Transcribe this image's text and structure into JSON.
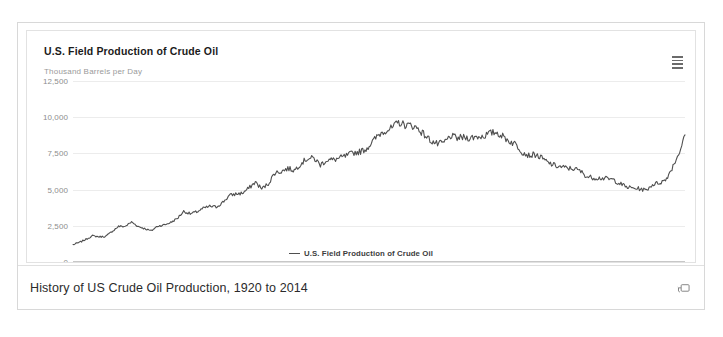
{
  "card": {
    "chart": {
      "title": "U.S. Field Production of Crude Oil",
      "yaxis_title": "Thousand Barrels per Day",
      "menu_icon": "hamburger-menu-icon",
      "legend": {
        "marker": "line-dash-marker",
        "label": "U.S. Field Production of Crude Oil"
      }
    },
    "footer": {
      "caption": "History of US Crude Oil Production, 1920 to 2014",
      "popout_icon": "popout-window-icon"
    }
  },
  "chart_data": {
    "type": "line",
    "title": "U.S. Field Production of Crude Oil",
    "subtitle": "",
    "xlabel": "",
    "ylabel": "Thousand Barrels per Day",
    "xlim": [
      1920,
      2014
    ],
    "ylim": [
      0,
      12500
    ],
    "ytick_labels": [
      "0",
      "2,500",
      "5,000",
      "7,500",
      "10,000",
      "12,500"
    ],
    "ytick_values": [
      0,
      2500,
      5000,
      7500,
      10000,
      12500
    ],
    "xtick_labels": [
      "1920",
      "1930",
      "1940",
      "1950",
      "1960",
      "1970",
      "1980",
      "1990",
      "2000",
      "2010"
    ],
    "xtick_values": [
      1920,
      1930,
      1940,
      1950,
      1960,
      1970,
      1980,
      1990,
      2000,
      2010
    ],
    "grid": true,
    "legend_position": "bottom-center",
    "line_color": "#4f4f4f",
    "series": [
      {
        "name": "U.S. Field Production of Crude Oil",
        "x": [
          1920,
          1921,
          1922,
          1923,
          1924,
          1925,
          1926,
          1927,
          1928,
          1929,
          1930,
          1931,
          1932,
          1933,
          1934,
          1935,
          1936,
          1937,
          1938,
          1939,
          1940,
          1941,
          1942,
          1943,
          1944,
          1945,
          1946,
          1947,
          1948,
          1949,
          1950,
          1951,
          1952,
          1953,
          1954,
          1955,
          1956,
          1957,
          1958,
          1959,
          1960,
          1961,
          1962,
          1963,
          1964,
          1965,
          1966,
          1967,
          1968,
          1969,
          1970,
          1971,
          1972,
          1973,
          1974,
          1975,
          1976,
          1977,
          1978,
          1979,
          1980,
          1981,
          1982,
          1983,
          1984,
          1985,
          1986,
          1987,
          1988,
          1989,
          1990,
          1991,
          1992,
          1993,
          1994,
          1995,
          1996,
          1997,
          1998,
          1999,
          2000,
          2001,
          2002,
          2003,
          2004,
          2005,
          2006,
          2007,
          2008,
          2009,
          2010,
          2011,
          2012,
          2013,
          2014
        ],
        "values": [
          1200,
          1350,
          1570,
          1810,
          1740,
          1760,
          2110,
          2460,
          2460,
          2760,
          2460,
          2310,
          2150,
          2480,
          2560,
          2730,
          3000,
          3500,
          3330,
          3460,
          3700,
          3840,
          3800,
          4120,
          4580,
          4700,
          4750,
          5090,
          5520,
          5050,
          5410,
          6160,
          6260,
          6460,
          6340,
          6810,
          7150,
          7170,
          6710,
          7050,
          7050,
          7180,
          7330,
          7540,
          7610,
          7800,
          8300,
          8810,
          9100,
          9240,
          9640,
          9460,
          9440,
          9210,
          8770,
          8370,
          8130,
          8240,
          8700,
          8550,
          8600,
          8570,
          8650,
          8690,
          8880,
          8970,
          8680,
          8350,
          8140,
          7610,
          7360,
          7420,
          7170,
          6850,
          6660,
          6560,
          6470,
          6450,
          6250,
          5880,
          5820,
          5800,
          5750,
          5680,
          5420,
          5180,
          5100,
          5060,
          4950,
          5350,
          5470,
          5650,
          6490,
          7450,
          8700
        ]
      }
    ],
    "annotations": []
  }
}
